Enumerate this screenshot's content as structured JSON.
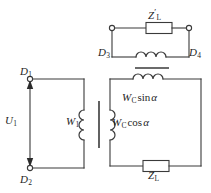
{
  "figure": {
    "kind": "electrical-circuit-diagram",
    "line_color": "#3a3a3a",
    "text_color": "#1f1f1f",
    "background": "#ffffff"
  },
  "top_circuit": {
    "name": "upper-loop",
    "terminal_left": {
      "label": "D",
      "sub": "3"
    },
    "terminal_right": {
      "label": "D",
      "sub": "4"
    },
    "impedance": {
      "label": "Z",
      "prime": "′",
      "sub": "L"
    },
    "coil_name": "secondary-coil-upper",
    "core_bar_name": "transformer-core-bar-horizontal"
  },
  "left_circuit": {
    "name": "primary-loop",
    "terminal_top": {
      "label": "D",
      "sub": "1"
    },
    "terminal_bottom": {
      "label": "D",
      "sub": "2"
    },
    "source_voltage": {
      "label": "U",
      "sub": "1"
    },
    "winding": {
      "label": "W",
      "sub": "1"
    },
    "arrow_top_direction": "up",
    "arrow_bottom_direction": "down",
    "core_name": "transformer-core-bar-vertical"
  },
  "right_circuit": {
    "name": "secondary-loop",
    "coil_top": {
      "label": "W",
      "sub": "C",
      "expr": "sin",
      "angle": "α"
    },
    "coil_left": {
      "label": "W",
      "sub": "C",
      "expr": "cos",
      "angle": "α"
    },
    "load": {
      "label": "Z",
      "sub": "L"
    }
  }
}
